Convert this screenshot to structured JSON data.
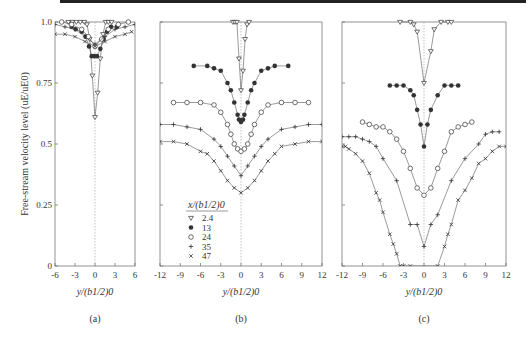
{
  "chart_data": [
    {
      "type": "scatter",
      "panel": "(a)",
      "title": "",
      "xlabel": "y/(b1/2)0",
      "ylabel": "Free-stream velocity level (uE/uE0)",
      "xlim": [
        -6,
        6
      ],
      "ylim": [
        0,
        1.0
      ],
      "xticks": [
        -6,
        -3,
        0,
        3,
        6
      ],
      "yticks": [
        0,
        0.25,
        0.5,
        0.75,
        1.0
      ],
      "ytick_labels": [
        "0",
        "0.25",
        "0.5",
        "0.75",
        "1.0"
      ],
      "grid": false,
      "center_line": 0,
      "series": [
        {
          "name": "2.4",
          "marker": "triangle-down-open",
          "x": [
            -4.0,
            -3.4,
            -2.8,
            -2.2,
            -1.6,
            -1.2,
            -0.8,
            -0.4,
            0,
            0.4,
            0.8,
            1.2,
            1.6,
            2.0,
            2.5
          ],
          "y": [
            1.0,
            1.0,
            1.0,
            1.0,
            1.0,
            0.99,
            0.93,
            0.78,
            0.61,
            0.71,
            0.85,
            0.95,
            1.0,
            1.0,
            1.0
          ]
        },
        {
          "name": "13",
          "marker": "filled-circle",
          "x": [
            -3.5,
            -2.9,
            -2.0,
            -1.4,
            -0.9,
            -0.5,
            -0.1,
            0.3,
            0.8,
            1.3,
            1.8,
            2.4,
            3.3
          ],
          "y": [
            0.98,
            0.97,
            0.96,
            0.94,
            0.9,
            0.86,
            0.86,
            0.86,
            0.89,
            0.93,
            0.96,
            0.98,
            0.98
          ]
        },
        {
          "name": "24",
          "marker": "open-circle",
          "x": [
            -5.0,
            -3.5,
            -2.0,
            -1.0,
            0,
            1.0,
            2.0,
            3.5,
            5.0
          ],
          "y": [
            1.0,
            0.99,
            0.97,
            0.94,
            0.9,
            0.93,
            0.97,
            0.99,
            1.0
          ]
        },
        {
          "name": "35",
          "marker": "plus",
          "x": [
            -6,
            -4.5,
            -3.0,
            -1.5,
            0,
            1.5,
            3.0,
            4.5,
            6
          ],
          "y": [
            0.99,
            0.98,
            0.97,
            0.94,
            0.91,
            0.94,
            0.97,
            0.98,
            0.99
          ]
        },
        {
          "name": "47",
          "marker": "cross",
          "x": [
            -6,
            -4.5,
            -3.0,
            -1.5,
            0,
            1.5,
            3.0,
            4.5,
            5.5
          ],
          "y": [
            0.95,
            0.95,
            0.94,
            0.92,
            0.9,
            0.92,
            0.94,
            0.95,
            0.96
          ]
        }
      ]
    },
    {
      "type": "scatter",
      "panel": "(b)",
      "xlabel": "y/(b1/2)0",
      "xlim": [
        -12,
        12
      ],
      "ylim": [
        0,
        1.0
      ],
      "xticks": [
        -12,
        -9,
        -6,
        -3,
        0,
        3,
        6,
        9,
        12
      ],
      "grid": false,
      "center_line": 0,
      "legend": {
        "title": "x/(b1/2)0",
        "position": "lower-left",
        "entries": [
          "2.4",
          "13",
          "24",
          "35",
          "47"
        ]
      },
      "series": [
        {
          "name": "2.4",
          "marker": "triangle-down-open",
          "x": [
            -1.2,
            -0.9,
            -0.6,
            -0.3,
            0,
            0.3,
            0.6,
            0.9,
            1.2
          ],
          "y": [
            1.0,
            1.0,
            1.0,
            0.85,
            0.72,
            0.8,
            0.93,
            0.99,
            1.0
          ]
        },
        {
          "name": "13",
          "marker": "filled-circle",
          "x": [
            -7,
            -5,
            -4,
            -3,
            -2,
            -1.5,
            -1,
            -0.5,
            -0.3,
            0,
            0.3,
            0.5,
            1,
            1.5,
            2,
            3,
            4,
            5,
            7
          ],
          "y": [
            0.82,
            0.82,
            0.81,
            0.8,
            0.75,
            0.72,
            0.67,
            0.62,
            0.6,
            0.59,
            0.6,
            0.62,
            0.67,
            0.72,
            0.75,
            0.8,
            0.81,
            0.82,
            0.82
          ]
        },
        {
          "name": "24",
          "marker": "open-circle",
          "x": [
            -10,
            -8,
            -6,
            -4,
            -3,
            -2,
            -1.5,
            -1,
            -0.5,
            0,
            0.5,
            1,
            1.5,
            2,
            3,
            4,
            6,
            8,
            10
          ],
          "y": [
            0.67,
            0.67,
            0.67,
            0.66,
            0.63,
            0.58,
            0.54,
            0.5,
            0.48,
            0.47,
            0.48,
            0.5,
            0.54,
            0.58,
            0.63,
            0.66,
            0.67,
            0.67,
            0.67
          ]
        },
        {
          "name": "35",
          "marker": "plus",
          "x": [
            -12,
            -10,
            -8,
            -6,
            -4,
            -3,
            -2,
            -1,
            0,
            1,
            2,
            3,
            4,
            6,
            8,
            10,
            12
          ],
          "y": [
            0.58,
            0.58,
            0.57,
            0.56,
            0.52,
            0.49,
            0.45,
            0.41,
            0.37,
            0.41,
            0.45,
            0.49,
            0.52,
            0.56,
            0.57,
            0.58,
            0.58
          ]
        },
        {
          "name": "47",
          "marker": "cross",
          "x": [
            -12,
            -10,
            -8,
            -6,
            -5,
            -4,
            -3,
            -2,
            -1,
            0,
            1,
            2,
            3,
            4,
            5,
            6,
            8,
            10,
            12
          ],
          "y": [
            0.51,
            0.51,
            0.5,
            0.47,
            0.46,
            0.43,
            0.39,
            0.35,
            0.32,
            0.3,
            0.32,
            0.35,
            0.39,
            0.43,
            0.46,
            0.49,
            0.5,
            0.51,
            0.51
          ]
        }
      ]
    },
    {
      "type": "scatter",
      "panel": "(c)",
      "xlabel": "y/(b1/2)0",
      "xlim": [
        -12,
        12
      ],
      "ylim": [
        0,
        1.0
      ],
      "xticks": [
        -12,
        -9,
        -6,
        -3,
        0,
        3,
        6,
        9,
        12
      ],
      "grid": false,
      "center_line": 0,
      "series": [
        {
          "name": "2.4",
          "marker": "triangle-down-open",
          "x": [
            -3.5,
            -2,
            -1.5,
            -1,
            0,
            1,
            1.5,
            2.5,
            3.5,
            4
          ],
          "y": [
            1.0,
            1.0,
            0.99,
            0.96,
            0.75,
            0.88,
            0.97,
            1.0,
            1.0,
            1.0
          ]
        },
        {
          "name": "13",
          "marker": "filled-circle",
          "x": [
            -5,
            -4,
            -3,
            -2,
            -1.5,
            -1,
            -0.5,
            0,
            0.5,
            1,
            2,
            3,
            4,
            5
          ],
          "y": [
            0.74,
            0.74,
            0.74,
            0.72,
            0.7,
            0.64,
            0.58,
            0.49,
            0.58,
            0.64,
            0.7,
            0.74,
            0.74,
            0.74
          ]
        },
        {
          "name": "24",
          "marker": "open-circle",
          "x": [
            -9,
            -8,
            -7,
            -6,
            -5,
            -4,
            -3,
            -2,
            -1,
            0,
            1,
            2,
            3,
            4,
            5,
            6,
            7
          ],
          "y": [
            0.59,
            0.58,
            0.57,
            0.57,
            0.55,
            0.52,
            0.47,
            0.4,
            0.32,
            0.29,
            0.32,
            0.4,
            0.47,
            0.55,
            0.57,
            0.58,
            0.59
          ]
        },
        {
          "name": "35",
          "marker": "plus",
          "x": [
            -12,
            -11,
            -10,
            -9,
            -8,
            -7,
            -6,
            -4,
            -2,
            -1,
            0,
            1,
            2,
            4,
            6,
            8,
            9,
            10,
            11
          ],
          "y": [
            0.53,
            0.53,
            0.53,
            0.52,
            0.51,
            0.49,
            0.44,
            0.35,
            0.17,
            0.17,
            0.08,
            0.17,
            0.21,
            0.35,
            0.44,
            0.5,
            0.54,
            0.55,
            0.55
          ]
        },
        {
          "name": "47",
          "marker": "cross",
          "x": [
            -12,
            -11.5,
            -11,
            -10,
            -9,
            -8,
            -7,
            -6.5,
            -6,
            -5,
            -4.5,
            -4,
            -3.5,
            -3,
            -2,
            2,
            3,
            3.5,
            4,
            5,
            6,
            7,
            8,
            9,
            10,
            11,
            12
          ],
          "y": [
            0.49,
            0.49,
            0.48,
            0.46,
            0.43,
            0.38,
            0.3,
            0.27,
            0.22,
            0.13,
            0.09,
            0.05,
            0.0,
            0.0,
            0.0,
            0.0,
            0.08,
            0.13,
            0.17,
            0.27,
            0.31,
            0.36,
            0.42,
            0.44,
            0.47,
            0.49,
            0.49
          ]
        }
      ]
    }
  ],
  "figure": {
    "ylabel": "Free-stream velocity level (uE/uE0)",
    "xlabel": "y/(b1/2)0",
    "legend_title": "x/(b1/2)0",
    "panels": [
      "(a)",
      "(b)",
      "(c)"
    ],
    "colors": {
      "line": "#555555",
      "axis": "#666666",
      "marker": "#333333",
      "center_line": "#999999"
    }
  }
}
